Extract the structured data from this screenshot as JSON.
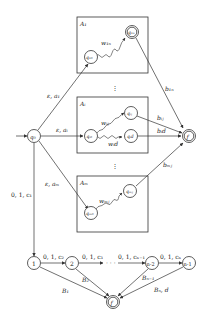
{
  "diagram": {
    "type": "automaton",
    "initial_state": "q0",
    "final_state_label": "f",
    "boxes": [
      {
        "id": "A1",
        "label": "A₁",
        "start_state": "q₁₀",
        "end_state": "q₁ₙ",
        "path_label": "w₁ₙ"
      },
      {
        "id": "Ai",
        "label": "Aᵢ",
        "start_state": "qᵢ₀",
        "end_states": [
          "qᵢⱼ",
          "qᵢd"
        ],
        "path_labels": [
          "wᵢⱼ",
          "wᵢd"
        ]
      },
      {
        "id": "Am",
        "label": "Aₘ",
        "start_state": "qₘ₀",
        "end_state": "qₘⱼ",
        "path_label": "wₘⱼ"
      }
    ],
    "nodes": {
      "q0": "q₀",
      "f": "f",
      "q10": "q₁₀",
      "q1n": "q₁ₙ",
      "qi0": "qᵢ₀",
      "qij": "qᵢⱼ",
      "qid": "qᵢd",
      "qm0": "qₘ₀",
      "qmj": "qₘⱼ",
      "f2": "f",
      "c1": "1",
      "c2": "2",
      "cn2": "n-2",
      "cn1": "n-1"
    },
    "edge_labels": {
      "q0_to_A1": "ε, a₁",
      "q0_to_Ai": "ε, aᵢ",
      "q0_to_Am": "ε, aₘ",
      "q0_to_1": "0, 1, c₁",
      "A1_to_f": "b₁ₙ",
      "Ai_j_to_f": "bᵢⱼ",
      "Ai_d_to_f": "bᵢd",
      "Am_to_f": "bₘⱼ",
      "w1n": "w₁ₙ",
      "wij": "wᵢⱼ",
      "wid": "wᵢd",
      "wmj": "wₘⱼ",
      "1_to_2": "0, 1, c₂",
      "2_to_dots": "0, 1, c₃",
      "dots_to_n2": "0, 1, cₙ₋₁",
      "n2_to_n1": "0, 1, cₙ",
      "1_to_f": "B₁",
      "2_to_f": "B₂",
      "n2_to_f": "Bₙ₋₁",
      "n1_to_f": "Bₙ, d"
    },
    "ellipsis": "⋮",
    "hellipsis": "· · ·"
  }
}
